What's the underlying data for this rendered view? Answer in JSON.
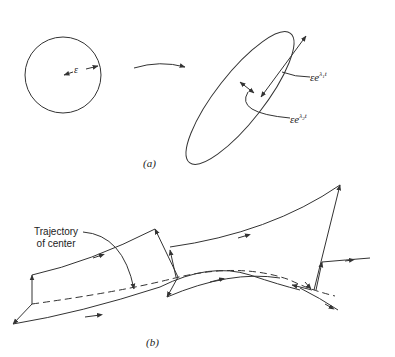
{
  "panel_a": {
    "caption": "(a)",
    "circle_radius_label": "ε",
    "major_axis_label": {
      "base": "εe",
      "exp": "λ",
      "sub": "1",
      "tail": "t"
    },
    "minor_axis_label": {
      "base": "εe",
      "exp": "λ",
      "sub": "2",
      "tail": "t"
    }
  },
  "panel_b": {
    "caption": "(b)",
    "trajectory_label_line1": "Trajectory",
    "trajectory_label_line2": "of center"
  },
  "colors": {
    "ink": "#333333",
    "background": "#ffffff"
  }
}
